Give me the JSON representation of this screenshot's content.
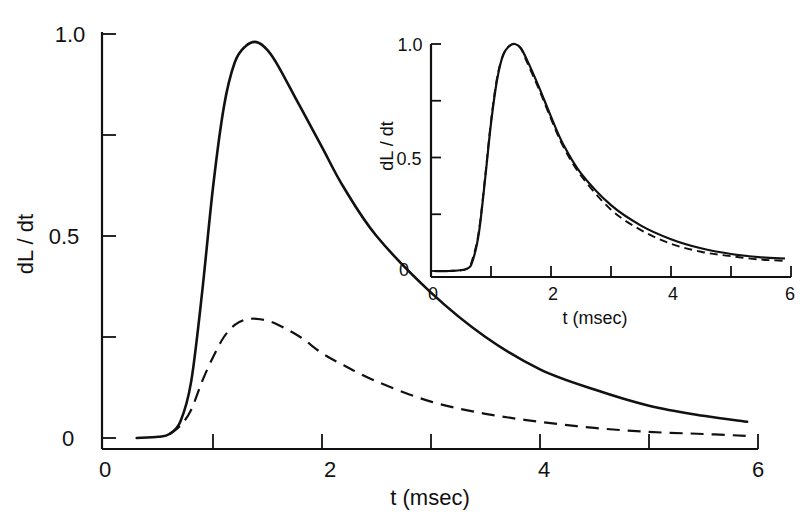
{
  "chart_data": [
    {
      "id": "main",
      "type": "line",
      "title": "",
      "xlabel": "t (msec)",
      "ylabel": "dL / dt",
      "xlim": [
        0,
        6
      ],
      "ylim": [
        0,
        1.0
      ],
      "grid": false,
      "legend": null,
      "x_tick_labels": [
        "0",
        "2",
        "4",
        "6"
      ],
      "x_ticks": [
        0,
        1,
        2,
        3,
        4,
        5,
        6
      ],
      "y_tick_labels": [
        "0",
        "0.5",
        "1.0"
      ],
      "y_ticks": [
        0,
        0.25,
        0.5,
        0.75,
        1.0
      ],
      "series": [
        {
          "name": "solid",
          "style": "solid",
          "x": [
            0.3,
            0.5,
            0.6,
            0.7,
            0.8,
            0.9,
            1.0,
            1.1,
            1.2,
            1.3,
            1.4,
            1.5,
            1.6,
            1.8,
            2.0,
            2.2,
            2.5,
            3.0,
            3.5,
            4.0,
            4.5,
            5.0,
            5.5,
            5.9
          ],
          "values": [
            0.0,
            0.003,
            0.01,
            0.04,
            0.14,
            0.36,
            0.62,
            0.82,
            0.93,
            0.97,
            0.98,
            0.96,
            0.92,
            0.82,
            0.72,
            0.62,
            0.5,
            0.36,
            0.25,
            0.17,
            0.12,
            0.08,
            0.055,
            0.04
          ]
        },
        {
          "name": "dashed",
          "style": "dashed",
          "x": [
            0.6,
            0.7,
            0.8,
            0.9,
            1.0,
            1.1,
            1.2,
            1.3,
            1.4,
            1.5,
            1.6,
            1.8,
            2.0,
            2.2,
            2.5,
            3.0,
            3.5,
            4.0,
            4.5,
            5.0,
            5.5,
            5.9
          ],
          "values": [
            0.01,
            0.03,
            0.07,
            0.14,
            0.2,
            0.25,
            0.28,
            0.293,
            0.295,
            0.29,
            0.28,
            0.25,
            0.21,
            0.18,
            0.14,
            0.09,
            0.06,
            0.04,
            0.025,
            0.015,
            0.01,
            0.005
          ]
        }
      ]
    },
    {
      "id": "inset",
      "type": "line",
      "title": "",
      "xlabel": "t (msec)",
      "ylabel": "dL / dt",
      "xlim": [
        0,
        6
      ],
      "ylim": [
        0,
        1.0
      ],
      "grid": false,
      "legend": null,
      "x_tick_labels": [
        "0",
        "2",
        "4",
        "6"
      ],
      "x_ticks": [
        0,
        1,
        2,
        3,
        4,
        5,
        6
      ],
      "y_tick_labels": [
        "0",
        "0.5",
        "1.0"
      ],
      "y_ticks": [
        0,
        0.25,
        0.5,
        0.75,
        1.0
      ],
      "series": [
        {
          "name": "solid (normalized)",
          "style": "solid",
          "x": [
            0.05,
            0.3,
            0.6,
            0.7,
            0.8,
            0.9,
            1.0,
            1.1,
            1.2,
            1.3,
            1.4,
            1.5,
            1.6,
            1.8,
            2.0,
            2.2,
            2.5,
            3.0,
            3.5,
            4.0,
            4.5,
            5.0,
            5.5,
            5.9
          ],
          "values": [
            0.0,
            0.0,
            0.01,
            0.05,
            0.17,
            0.4,
            0.65,
            0.84,
            0.95,
            0.99,
            1.0,
            0.98,
            0.93,
            0.81,
            0.68,
            0.56,
            0.43,
            0.29,
            0.2,
            0.14,
            0.1,
            0.075,
            0.06,
            0.055
          ]
        },
        {
          "name": "dashed (normalized)",
          "style": "dashed",
          "x": [
            0.05,
            0.3,
            0.6,
            0.7,
            0.8,
            0.9,
            1.0,
            1.1,
            1.2,
            1.3,
            1.4,
            1.5,
            1.6,
            1.8,
            2.0,
            2.2,
            2.5,
            3.0,
            3.5,
            4.0,
            4.5,
            5.0,
            5.5,
            5.9
          ],
          "values": [
            0.0,
            0.0,
            0.01,
            0.06,
            0.18,
            0.41,
            0.66,
            0.85,
            0.95,
            0.99,
            1.0,
            0.98,
            0.92,
            0.8,
            0.67,
            0.55,
            0.42,
            0.27,
            0.18,
            0.12,
            0.085,
            0.065,
            0.05,
            0.045
          ]
        }
      ]
    }
  ]
}
